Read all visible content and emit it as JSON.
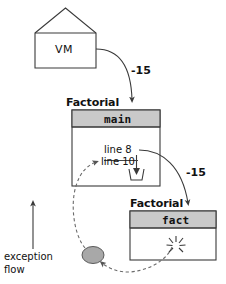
{
  "diagram": {
    "title": "exception flow",
    "vm": {
      "label": "VM",
      "shape": "house-pentagon"
    },
    "frames": [
      {
        "class_label": "Factorial",
        "method_label": "main",
        "lines": [
          {
            "label": "line 8"
          },
          {
            "label": "line 10"
          }
        ],
        "catch_icon": "catch-cup-icon"
      },
      {
        "class_label": "Factorial",
        "method_label": "fact",
        "throw_icon": "exception-burst-icon"
      }
    ],
    "edges": [
      {
        "name": "vm-to-main",
        "label": "-15",
        "style": "solid"
      },
      {
        "name": "main-to-fact",
        "label": "-15",
        "style": "solid"
      }
    ],
    "exception_object": {
      "name": "exception-object",
      "shape": "ellipse",
      "color": "#a8a8a8"
    },
    "legend": {
      "line1": "exception",
      "line2": "flow",
      "arrow_icon": "up-arrow-icon"
    },
    "colors": {
      "stroke": "#3a3a3a",
      "header_fill": "#c9c9c9",
      "box_fill": "#ffffff",
      "dashed_stroke": "#6b6b6b",
      "exception_fill": "#a8a8a8"
    }
  }
}
